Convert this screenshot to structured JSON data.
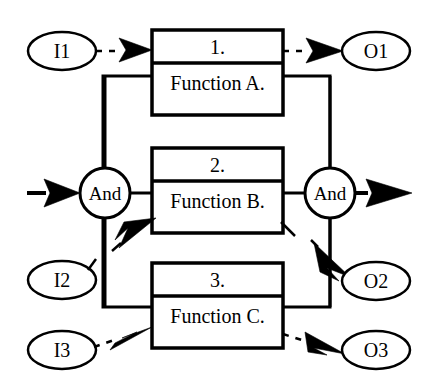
{
  "diagram": {
    "type": "block-function-diagram",
    "title": "",
    "background_color": "#ffffff",
    "line_color": "#000000",
    "fill_color": "#ffffff",
    "inputs": [
      {
        "id": "I1",
        "label": "I1",
        "shape": "ellipse",
        "cx": 62,
        "cy": 51,
        "rx": 34,
        "ry": 19
      },
      {
        "id": "I2",
        "label": "I2",
        "shape": "ellipse",
        "cx": 62,
        "cy": 280,
        "rx": 34,
        "ry": 19
      },
      {
        "id": "I3",
        "label": "I3",
        "shape": "ellipse",
        "cx": 62,
        "cy": 350,
        "rx": 34,
        "ry": 19
      }
    ],
    "outputs": [
      {
        "id": "O1",
        "label": "O1",
        "shape": "ellipse",
        "cx": 376,
        "cy": 51,
        "rx": 34,
        "ry": 19
      },
      {
        "id": "O2",
        "label": "O2",
        "shape": "ellipse",
        "cx": 376,
        "cy": 281,
        "rx": 34,
        "ry": 19
      },
      {
        "id": "O3",
        "label": "O3",
        "shape": "ellipse",
        "cx": 376,
        "cy": 350,
        "rx": 34,
        "ry": 19
      }
    ],
    "gates": [
      {
        "id": "and-left",
        "label": "And",
        "shape": "circle",
        "cx": 105,
        "cy": 193,
        "r": 25
      },
      {
        "id": "and-right",
        "label": "And",
        "shape": "circle",
        "cx": 330,
        "cy": 193,
        "r": 25
      }
    ],
    "function_blocks": [
      {
        "id": "block-1",
        "number": "1.",
        "name": "Function A.",
        "x": 152,
        "y": 30,
        "width": 131,
        "height": 85,
        "header_height": 33
      },
      {
        "id": "block-2",
        "number": "2.",
        "name": "Function B.",
        "x": 152,
        "y": 148,
        "width": 131,
        "height": 85,
        "header_height": 33
      },
      {
        "id": "block-3",
        "number": "3.",
        "name": "Function C.",
        "x": 152,
        "y": 263,
        "width": 131,
        "height": 85,
        "header_height": 33
      }
    ],
    "connections": [
      {
        "id": "conn-i1-block1",
        "from": "I1",
        "to": "block-1",
        "style": "dashed",
        "arrow": "solid-filled"
      },
      {
        "id": "conn-block1-o1",
        "from": "block-1",
        "to": "O1",
        "style": "dashed",
        "arrow": "solid-filled"
      },
      {
        "id": "conn-in-andleft",
        "from": "external-input",
        "to": "and-left",
        "style": "solid",
        "arrow": "solid-filled"
      },
      {
        "id": "conn-andleft-block2",
        "from": "and-left",
        "to": "block-2",
        "style": "solid",
        "arrow": "none"
      },
      {
        "id": "conn-block2-andright",
        "from": "block-2",
        "to": "and-right",
        "style": "solid",
        "arrow": "none"
      },
      {
        "id": "conn-andright-out",
        "from": "and-right",
        "to": "external-output",
        "style": "solid",
        "arrow": "solid-filled"
      },
      {
        "id": "conn-andright-o2",
        "from": "and-right",
        "to": "O2",
        "style": "solid",
        "arrow": "solid-filled"
      },
      {
        "id": "conn-i3-block3",
        "from": "I3",
        "to": "block-3",
        "style": "dashed",
        "arrow": "solid-filled"
      },
      {
        "id": "conn-block3-o3",
        "from": "block-3",
        "to": "O3",
        "style": "dashed",
        "arrow": "solid-filled"
      },
      {
        "id": "conn-left-bus",
        "from": "block-1",
        "to": "block-3",
        "style": "solid",
        "arrow": "none",
        "path": "left-vertical-bus"
      },
      {
        "id": "conn-right-bus",
        "from": "block-1",
        "to": "block-3",
        "style": "solid",
        "arrow": "none",
        "path": "right-vertical-bus"
      },
      {
        "id": "conn-into-block2-diagonal",
        "from": "and-left",
        "to": "block-2",
        "style": "solid",
        "arrow": "solid-filled-diagonal"
      }
    ],
    "geometry": {
      "left_bus_x": 103,
      "right_bus_x": 330,
      "bus_top_y": 76,
      "bus_bottom_y": 307
    }
  }
}
